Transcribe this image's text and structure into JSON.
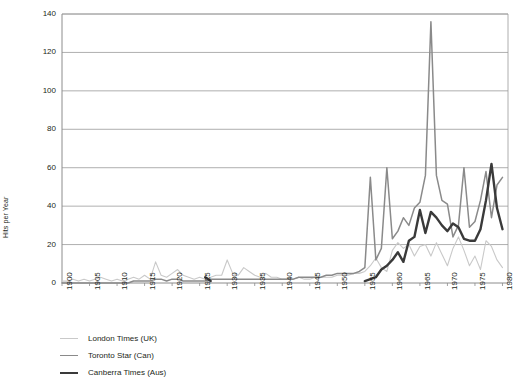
{
  "chart_data": {
    "type": "line",
    "title": "",
    "xlabel": "",
    "ylabel": "Hits per Year",
    "xlim": [
      1900,
      1981
    ],
    "ylim": [
      0,
      140
    ],
    "ytick_step": 20,
    "xtick_step": 5,
    "grid": true,
    "legend_position": "below-left",
    "yticks": [
      0,
      20,
      40,
      60,
      80,
      100,
      120,
      140
    ],
    "xticks": [
      1900,
      1905,
      1910,
      1915,
      1920,
      1925,
      1930,
      1935,
      1940,
      1945,
      1950,
      1955,
      1960,
      1965,
      1970,
      1975,
      1980
    ],
    "x": [
      1900,
      1901,
      1902,
      1903,
      1904,
      1905,
      1906,
      1907,
      1908,
      1909,
      1910,
      1911,
      1912,
      1913,
      1914,
      1915,
      1916,
      1917,
      1918,
      1919,
      1920,
      1921,
      1922,
      1923,
      1924,
      1925,
      1926,
      1927,
      1928,
      1929,
      1930,
      1931,
      1932,
      1933,
      1934,
      1935,
      1936,
      1937,
      1938,
      1939,
      1940,
      1941,
      1942,
      1943,
      1944,
      1945,
      1946,
      1947,
      1948,
      1949,
      1950,
      1951,
      1952,
      1953,
      1954,
      1955,
      1956,
      1957,
      1958,
      1959,
      1960,
      1961,
      1962,
      1963,
      1964,
      1965,
      1966,
      1967,
      1968,
      1969,
      1970,
      1971,
      1972,
      1973,
      1974,
      1975,
      1976,
      1977,
      1978,
      1979,
      1980
    ],
    "series": [
      {
        "name": "London Times (UK)",
        "color": "#c9c9c9",
        "width": 1.1,
        "values": [
          1,
          1,
          2,
          1,
          2,
          1,
          2,
          3,
          2,
          1,
          2,
          1,
          2,
          3,
          2,
          4,
          2,
          11,
          4,
          3,
          5,
          7,
          4,
          3,
          2,
          3,
          2,
          3,
          4,
          4,
          12,
          5,
          4,
          8,
          6,
          4,
          3,
          5,
          3,
          3,
          2,
          2,
          2,
          3,
          2,
          2,
          3,
          3,
          3,
          3,
          4,
          4,
          4,
          5,
          5,
          6,
          9,
          13,
          8,
          6,
          17,
          21,
          18,
          20,
          14,
          19,
          20,
          14,
          21,
          15,
          9,
          18,
          24,
          17,
          9,
          14,
          7,
          22,
          19,
          12,
          8
        ]
      },
      {
        "name": "Toronto Star (Can)",
        "color": "#8a8a8a",
        "width": 1.5,
        "values": [
          0,
          0,
          0,
          0,
          0,
          0,
          0,
          0,
          0,
          0,
          0,
          0,
          0,
          1,
          1,
          1,
          1,
          2,
          2,
          1,
          2,
          2,
          1,
          1,
          1,
          1,
          1,
          2,
          2,
          2,
          2,
          2,
          2,
          2,
          2,
          2,
          2,
          2,
          2,
          2,
          2,
          2,
          2,
          3,
          3,
          3,
          3,
          3,
          4,
          4,
          5,
          5,
          5,
          5,
          6,
          8,
          55,
          12,
          18,
          60,
          23,
          27,
          34,
          30,
          39,
          42,
          56,
          136,
          56,
          43,
          41,
          24,
          30,
          60,
          29,
          32,
          43,
          58,
          34,
          51,
          55
        ]
      },
      {
        "name": "Canberra Times (Aus)",
        "color": "#3a3a3a",
        "width": 2.4,
        "values": [
          null,
          null,
          null,
          null,
          null,
          null,
          null,
          null,
          null,
          null,
          null,
          null,
          null,
          null,
          null,
          null,
          null,
          null,
          null,
          null,
          null,
          null,
          null,
          null,
          null,
          null,
          3,
          1,
          null,
          null,
          null,
          null,
          null,
          null,
          null,
          null,
          null,
          null,
          null,
          null,
          null,
          null,
          null,
          null,
          null,
          null,
          null,
          null,
          null,
          null,
          null,
          null,
          null,
          null,
          null,
          1,
          2,
          3,
          7,
          9,
          12,
          16,
          11,
          22,
          24,
          38,
          26,
          37,
          34,
          30,
          27,
          31,
          29,
          23,
          22,
          22,
          28,
          43,
          62,
          39,
          28
        ]
      }
    ]
  },
  "legend": {
    "items": [
      {
        "label": "London Times (UK)",
        "color": "#c9c9c9",
        "width": "1.2px"
      },
      {
        "label": "Toronto Star (Can)",
        "color": "#8a8a8a",
        "width": "1.8px"
      },
      {
        "label": "Canberra Times (Aus)",
        "color": "#3a3a3a",
        "width": "2.8px"
      }
    ]
  },
  "axes": {
    "y_title": "Hits per Year"
  }
}
